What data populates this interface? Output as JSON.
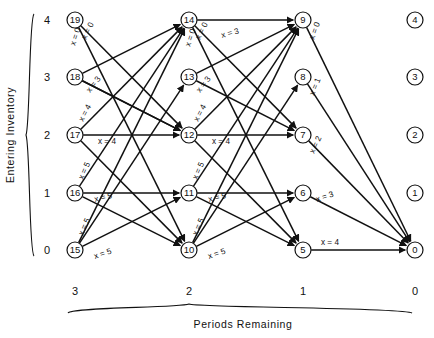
{
  "figure": {
    "kind": "network-diagram",
    "y_axis": {
      "title": "Entering Inventory",
      "ticks": [
        "4",
        "3",
        "2",
        "1",
        "0"
      ]
    },
    "x_axis": {
      "title": "Periods Remaining",
      "ticks": [
        "3",
        "2",
        "1",
        "0"
      ]
    }
  },
  "columns": [
    {
      "periods_remaining": "3",
      "x": 75,
      "nodes": [
        {
          "id": "19",
          "inventory": "4",
          "cy": 20
        },
        {
          "id": "18",
          "inventory": "3",
          "cy": 77
        },
        {
          "id": "17",
          "inventory": "2",
          "cy": 135
        },
        {
          "id": "16",
          "inventory": "1",
          "cy": 193
        },
        {
          "id": "15",
          "inventory": "0",
          "cy": 250
        }
      ]
    },
    {
      "periods_remaining": "2",
      "x": 189,
      "nodes": [
        {
          "id": "14",
          "inventory": "4",
          "cy": 20
        },
        {
          "id": "13",
          "inventory": "3",
          "cy": 77
        },
        {
          "id": "12",
          "inventory": "2",
          "cy": 135
        },
        {
          "id": "11",
          "inventory": "1",
          "cy": 193
        },
        {
          "id": "10",
          "inventory": "0",
          "cy": 250
        }
      ]
    },
    {
      "periods_remaining": "1",
      "x": 303,
      "nodes": [
        {
          "id": "9",
          "inventory": "4",
          "cy": 20
        },
        {
          "id": "8",
          "inventory": "3",
          "cy": 77
        },
        {
          "id": "7",
          "inventory": "2",
          "cy": 135
        },
        {
          "id": "6",
          "inventory": "1",
          "cy": 193
        },
        {
          "id": "5",
          "inventory": "0",
          "cy": 250
        }
      ]
    },
    {
      "periods_remaining": "0",
      "x": 415,
      "nodes": [
        {
          "id": "4",
          "inventory": "4",
          "cy": 20
        },
        {
          "id": "3",
          "inventory": "3",
          "cy": 77
        },
        {
          "id": "2",
          "inventory": "2",
          "cy": 135
        },
        {
          "id": "1",
          "inventory": "1",
          "cy": 193
        },
        {
          "id": "0",
          "inventory": "0",
          "cy": 250
        }
      ]
    }
  ],
  "edges": [
    {
      "from": "19",
      "to": "12",
      "label": "x = 0",
      "lx": 86,
      "ly": 40,
      "rot": -64
    },
    {
      "from": "19",
      "to": "10",
      "label": "x = 0",
      "lx": 75,
      "ly": 46,
      "rot": -71
    },
    {
      "from": "18",
      "to": "14",
      "label": "x = 3",
      "lx": 90,
      "ly": 93,
      "rot": -52
    },
    {
      "from": "18",
      "to": "12",
      "label": "",
      "lx": 0,
      "ly": 0,
      "rot": 0
    },
    {
      "from": "17",
      "to": "14",
      "label": "x = 4",
      "lx": 83,
      "ly": 122,
      "rot": -62
    },
    {
      "from": "17",
      "to": "12",
      "label": "x = 4",
      "lx": 98,
      "ly": 144,
      "rot": 0
    },
    {
      "from": "16",
      "to": "14",
      "label": "x = 5",
      "lx": 83,
      "ly": 180,
      "rot": -66
    },
    {
      "from": "16",
      "to": "11",
      "label": "x = 5",
      "lx": 95,
      "ly": 202,
      "rot": -13
    },
    {
      "from": "15",
      "to": "14",
      "label": "x = 5",
      "lx": 83,
      "ly": 236,
      "rot": -66
    },
    {
      "from": "15",
      "to": "11",
      "label": "x = 5",
      "lx": 95,
      "ly": 259,
      "rot": -19
    },
    {
      "from": "14",
      "to": "9",
      "label": "x = 3",
      "lx": 222,
      "ly": 38,
      "rot": -15
    },
    {
      "from": "14",
      "to": "7",
      "label": "x = 0",
      "lx": 200,
      "ly": 40,
      "rot": -64
    },
    {
      "from": "14",
      "to": "5",
      "label": "x = 0",
      "lx": 190,
      "ly": 47,
      "rot": -71
    },
    {
      "from": "13",
      "to": "9",
      "label": "x = 3",
      "lx": 200,
      "ly": 93,
      "rot": -52
    },
    {
      "from": "12",
      "to": "9",
      "label": "x = 4",
      "lx": 198,
      "ly": 122,
      "rot": -62
    },
    {
      "from": "12",
      "to": "7",
      "label": "x = 4",
      "lx": 212,
      "ly": 144,
      "rot": 0
    },
    {
      "from": "11",
      "to": "9",
      "label": "x = 5",
      "lx": 197,
      "ly": 180,
      "rot": -66
    },
    {
      "from": "11",
      "to": "6",
      "label": "x = 5",
      "lx": 209,
      "ly": 202,
      "rot": -13
    },
    {
      "from": "10",
      "to": "9",
      "label": "x = 5",
      "lx": 197,
      "ly": 236,
      "rot": -66
    },
    {
      "from": "10",
      "to": "6",
      "label": "x = 5",
      "lx": 209,
      "ly": 259,
      "rot": -19
    },
    {
      "from": "9",
      "to": "0",
      "label": "x = 0",
      "lx": 314,
      "ly": 40,
      "rot": -70
    },
    {
      "from": "8",
      "to": "0",
      "label": "x = 1",
      "lx": 314,
      "ly": 96,
      "rot": -68
    },
    {
      "from": "7",
      "to": "0",
      "label": "x = 2",
      "lx": 314,
      "ly": 154,
      "rot": -65
    },
    {
      "from": "6",
      "to": "0",
      "label": "x = 3",
      "lx": 317,
      "ly": 202,
      "rot": -18
    },
    {
      "from": "5",
      "to": "0",
      "label": "x = 4",
      "lx": 321,
      "ly": 245,
      "rot": 0
    }
  ],
  "extra_edges": [
    {
      "from": "18",
      "to": "12"
    },
    {
      "from": "13",
      "to": "7"
    },
    {
      "from": "17",
      "to": "10"
    },
    {
      "from": "12",
      "to": "5"
    },
    {
      "from": "16",
      "to": "10"
    },
    {
      "from": "11",
      "to": "5"
    },
    {
      "from": "15",
      "to": "13"
    },
    {
      "from": "10",
      "to": "8"
    }
  ]
}
